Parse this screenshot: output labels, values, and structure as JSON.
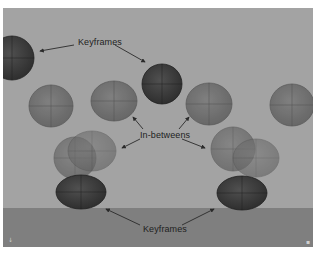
{
  "figure": {
    "labels": {
      "keyframes_top": "Keyframes",
      "inbetweens": "In-betweens",
      "keyframes_bottom": "Keyframes"
    },
    "corner_marks": {
      "bottom_left": "↓",
      "bottom_right": "▪"
    }
  },
  "colors": {
    "background": "#a3a3a3",
    "floor": "#7f7f7f",
    "keyframe_ball": "#3f3f3f",
    "inbetween_ball": "#6e6e6e",
    "text": "#1e1e1e",
    "arrow": "#2a2a2a"
  },
  "balls": [
    {
      "role": "keyframe",
      "cx": 12,
      "cy": 58,
      "rx": 22,
      "ry": 22
    },
    {
      "role": "in-between",
      "cx": 51,
      "cy": 106,
      "rx": 22,
      "ry": 21
    },
    {
      "role": "in-between",
      "cx": 114,
      "cy": 101,
      "rx": 23,
      "ry": 20
    },
    {
      "role": "keyframe",
      "cx": 162,
      "cy": 84,
      "rx": 20,
      "ry": 20
    },
    {
      "role": "in-between",
      "cx": 209,
      "cy": 104,
      "rx": 23,
      "ry": 21
    },
    {
      "role": "in-between",
      "cx": 292,
      "cy": 105,
      "rx": 22,
      "ry": 21
    },
    {
      "role": "in-between",
      "cx": 75,
      "cy": 158,
      "rx": 21,
      "ry": 21
    },
    {
      "role": "in-between",
      "cx": 92,
      "cy": 151,
      "rx": 24,
      "ry": 20
    },
    {
      "role": "keyframe-squash",
      "cx": 81,
      "cy": 192,
      "rx": 25,
      "ry": 17
    },
    {
      "role": "in-between",
      "cx": 233,
      "cy": 149,
      "rx": 22,
      "ry": 22
    },
    {
      "role": "in-between",
      "cx": 256,
      "cy": 158,
      "rx": 23,
      "ry": 19
    },
    {
      "role": "keyframe-squash",
      "cx": 242,
      "cy": 193,
      "rx": 25,
      "ry": 17
    }
  ]
}
